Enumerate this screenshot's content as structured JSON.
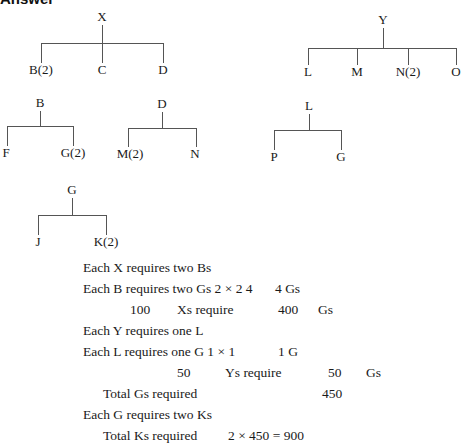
{
  "heading": "Answer",
  "trees": {
    "x": {
      "root": "X",
      "children": [
        "B(2)",
        "C",
        "D"
      ]
    },
    "y": {
      "root": "Y",
      "children": [
        "L",
        "M",
        "N(2)",
        "O"
      ]
    },
    "b": {
      "root": "B",
      "children": [
        "F",
        "G(2)"
      ]
    },
    "d": {
      "root": "D",
      "children": [
        "M(2)",
        "N"
      ]
    },
    "l": {
      "root": "L",
      "children": [
        "P",
        "G"
      ]
    },
    "g": {
      "root": "G",
      "children": [
        "J",
        "K(2)"
      ]
    }
  },
  "calc": {
    "r1": {
      "text": "Each X requires two Bs"
    },
    "r2": {
      "text": "Each B requires two Gs 2 × 2 4",
      "result": "4 Gs"
    },
    "r3": {
      "qty": "100",
      "label": "Xs require",
      "value": "400",
      "unit": "Gs"
    },
    "r4": {
      "text": "Each Y requires one L"
    },
    "r5": {
      "text": "Each L requires one G 1 × 1",
      "result": "1 G"
    },
    "r6": {
      "qty": "50",
      "label": "Ys require",
      "value": "50",
      "unit": "Gs"
    },
    "r7": {
      "text": "Total Gs required",
      "value": "450"
    },
    "r8": {
      "text": "Each G requires two Ks"
    },
    "r9": {
      "text": "Total Ks required",
      "value": "2 × 450 = 900"
    }
  }
}
